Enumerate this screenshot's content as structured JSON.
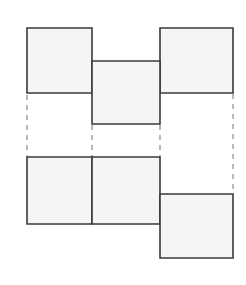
{
  "figure": {
    "width": 246,
    "height": 285,
    "background_color": "#ffffff"
  },
  "style": {
    "face_fill": "#f5f5f5",
    "face_stroke": "#3a3a3a",
    "face_stroke_width": 1.6,
    "fold_line_color": "#9a9a9a",
    "fold_line_width": 1.4,
    "fold_dash_pattern": "5 5"
  },
  "chart_data": {
    "type": "diagram",
    "units": "pixels",
    "faces": [
      {
        "id": "face-top-left",
        "label": "top-left square",
        "row": "upper",
        "column": "left",
        "x": 27,
        "y": 28,
        "width": 65,
        "height": 65
      },
      {
        "id": "face-top-middle",
        "label": "top-middle square",
        "row": "upper",
        "column": "middle",
        "x": 92,
        "y": 61,
        "width": 68,
        "height": 63
      },
      {
        "id": "face-top-right",
        "label": "top-right square",
        "row": "upper",
        "column": "right",
        "x": 160,
        "y": 28,
        "width": 73,
        "height": 65
      },
      {
        "id": "face-bottom-left",
        "label": "bottom-left square",
        "row": "lower",
        "column": "left",
        "x": 27,
        "y": 157,
        "width": 65,
        "height": 67
      },
      {
        "id": "face-bottom-middle",
        "label": "bottom-middle square",
        "row": "lower",
        "column": "middle",
        "x": 92,
        "y": 157,
        "width": 68,
        "height": 67
      },
      {
        "id": "face-bottom-right",
        "label": "bottom-right square",
        "row": "lower",
        "column": "right",
        "x": 160,
        "y": 194,
        "width": 73,
        "height": 64
      }
    ],
    "fold_lines": [
      {
        "id": "fold-line-left",
        "label": "left vertical dashed line",
        "orientation": "vertical",
        "x": 27,
        "y1": 95,
        "y2": 157
      },
      {
        "id": "fold-line-center-left",
        "label": "center-left vertical dashed line",
        "orientation": "vertical",
        "x": 92,
        "y1": 125,
        "y2": 157
      },
      {
        "id": "fold-line-center-right",
        "label": "center-right vertical dashed line",
        "orientation": "vertical",
        "x": 160,
        "y1": 125,
        "y2": 157
      },
      {
        "id": "fold-line-right",
        "label": "right vertical dashed line",
        "orientation": "vertical",
        "x": 233,
        "y1": 94,
        "y2": 194
      }
    ]
  }
}
